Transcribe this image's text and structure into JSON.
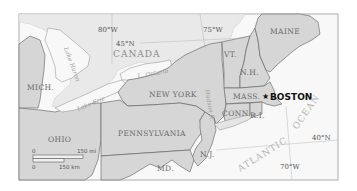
{
  "map": {
    "country": "CANADA",
    "states": {
      "maine": "MAINE",
      "vermont": "VT.",
      "new_hampshire": "N.H.",
      "massachusetts": "MASS.",
      "connecticut": "CONN.",
      "rhode_island": "R.I.",
      "new_york": "NEW YORK",
      "pennsylvania": "PENNSYLVANIA",
      "new_jersey": "N.J.",
      "maryland": "MD.",
      "ohio": "OHIO",
      "michigan": "MICH."
    },
    "city": {
      "name": "BOSTON",
      "marker": "star-icon"
    },
    "water": {
      "lake_huron": "Lake Huron",
      "lake_ontario": "L. Ontario",
      "lake_erie": "Lake Erie",
      "hudson": "Hudson R.",
      "ocean_1": "ATLANTIC",
      "ocean_2": "OCEAN"
    },
    "graticule": {
      "lon_80": "80°W",
      "lon_75": "75°W",
      "lon_70": "70°W",
      "lat_45": "45°N",
      "lat_40": "40°N"
    },
    "scale": {
      "zero_top": "0",
      "miles": "150 mi",
      "zero_bottom": "0",
      "km": "150 km"
    },
    "colors": {
      "land_us": "#d6d6d6",
      "land_canada": "#e9e9e9",
      "water": "#f8f8f8",
      "border": "#5a5a5a"
    }
  }
}
